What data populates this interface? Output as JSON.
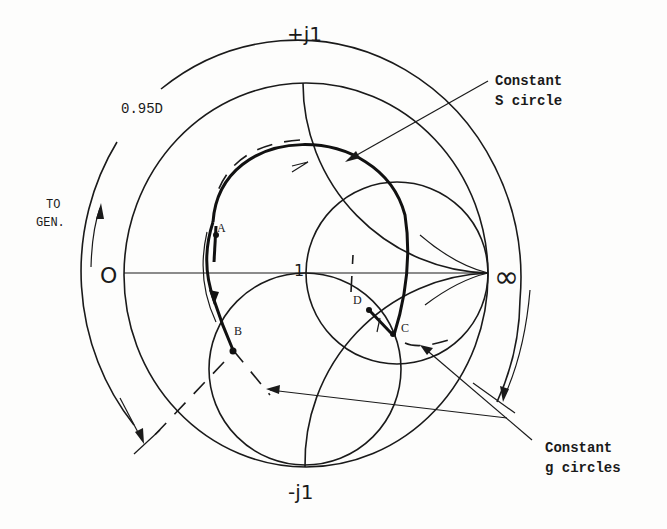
{
  "diagram": {
    "type": "Smith chart construction",
    "axis_labels": {
      "top": "+j1",
      "bottom": "-j1",
      "left": "O",
      "right": "∞",
      "center": "1"
    },
    "scale_label": "0.95D",
    "direction_label": {
      "line1": "TO",
      "line2": "GEN."
    },
    "points": [
      {
        "label": "A"
      },
      {
        "label": "B"
      },
      {
        "label": "C"
      },
      {
        "label": "D"
      }
    ],
    "callouts": {
      "s_circle": {
        "line1": "Constant",
        "line2": "S circle"
      },
      "g_circles": {
        "line1": "Constant",
        "line2": "g circles"
      }
    }
  }
}
